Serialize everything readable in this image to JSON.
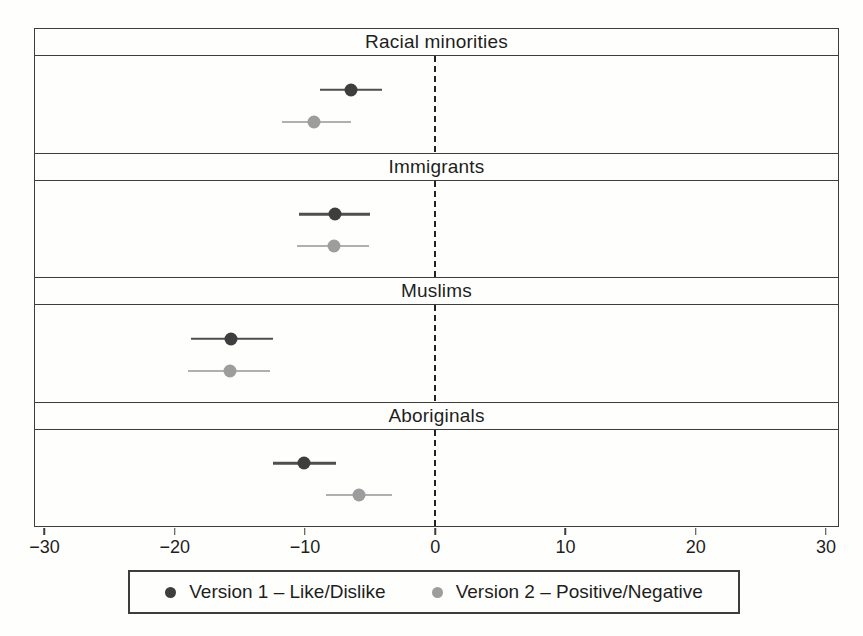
{
  "colors": {
    "background": "#fefefd",
    "text": "#1e1e1e",
    "border": "#3d3d3d",
    "zero_line": "#222222",
    "version1": "#3e3e3e",
    "version1_ci": "#4f4f4f",
    "version2": "#9d9d9d",
    "version2_ci": "#b0b0b0"
  },
  "axis": {
    "ticks": [
      -30,
      -20,
      -10,
      0,
      10,
      20,
      30
    ],
    "tick_labels": [
      "−30",
      "−20",
      "−10",
      "0",
      "10",
      "20",
      "30"
    ],
    "min": -30.8,
    "max": 31.0
  },
  "legend": {
    "position": "bottom",
    "items": [
      {
        "label": "Version 1 – Like/Dislike",
        "marker": "dark-circle-icon",
        "color": "#3e3e3e"
      },
      {
        "label": "Version 2 – Positive/Negative",
        "marker": "gray-circle-icon",
        "color": "#9d9d9d"
      }
    ]
  },
  "chart_data": {
    "type": "scatter",
    "subtype": "horizontal-coefficient-plot-with-ci",
    "grid": false,
    "legend_position": "bottom",
    "xlim": [
      -30.8,
      31.0
    ],
    "zero_reference_line": 0,
    "x_ticks": [
      -30,
      -20,
      -10,
      0,
      10,
      20,
      30
    ],
    "panels": [
      {
        "title": "Racial minorities",
        "series": [
          {
            "name": "Version 1 – Like/Dislike",
            "value": -6.5,
            "ci": [
              -8.9,
              -4.1
            ]
          },
          {
            "name": "Version 2 – Positive/Negative",
            "value": -9.3,
            "ci": [
              -11.8,
              -6.5
            ]
          }
        ]
      },
      {
        "title": "Immigrants",
        "series": [
          {
            "name": "Version 1 – Like/Dislike",
            "value": -7.7,
            "ci": [
              -10.5,
              -5.0
            ]
          },
          {
            "name": "Version 2 – Positive/Negative",
            "value": -7.8,
            "ci": [
              -10.6,
              -5.1
            ]
          }
        ]
      },
      {
        "title": "Muslims",
        "series": [
          {
            "name": "Version 1 – Like/Dislike",
            "value": -15.7,
            "ci": [
              -18.8,
              -12.5
            ]
          },
          {
            "name": "Version 2 – Positive/Negative",
            "value": -15.8,
            "ci": [
              -19.0,
              -12.7
            ]
          }
        ]
      },
      {
        "title": "Aboriginals",
        "series": [
          {
            "name": "Version 1 – Like/Dislike",
            "value": -10.1,
            "ci": [
              -12.5,
              -7.6
            ]
          },
          {
            "name": "Version 2 – Positive/Negative",
            "value": -5.9,
            "ci": [
              -8.4,
              -3.3
            ]
          }
        ]
      }
    ]
  }
}
